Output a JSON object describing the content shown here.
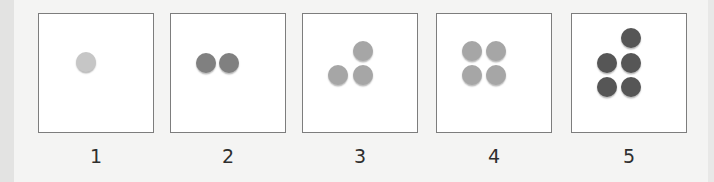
{
  "title": "",
  "colors": {
    "background": "#f4f4f3",
    "panel_border": "#7d7d7d",
    "label_text": "#2e2e2e"
  },
  "panels": [
    {
      "label": "1",
      "dot_count": 1,
      "dot_color": "#c6c6c6",
      "dots": [
        [
          47,
          48
        ]
      ]
    },
    {
      "label": "2",
      "dot_count": 2,
      "dot_color": "#808080",
      "dots": [
        [
          35,
          49
        ],
        [
          58,
          49
        ]
      ]
    },
    {
      "label": "3",
      "dot_count": 3,
      "dot_color": "#a6a6a6",
      "dots": [
        [
          60,
          37
        ],
        [
          35,
          61
        ],
        [
          60,
          61
        ]
      ]
    },
    {
      "label": "4",
      "dot_count": 4,
      "dot_color": "#a6a6a6",
      "dots": [
        [
          35,
          37
        ],
        [
          59,
          37
        ],
        [
          35,
          61
        ],
        [
          59,
          61
        ]
      ]
    },
    {
      "label": "5",
      "dot_count": 5,
      "dot_color": "#565656",
      "dots": [
        [
          59,
          24
        ],
        [
          35,
          49
        ],
        [
          59,
          49
        ],
        [
          35,
          73
        ],
        [
          59,
          73
        ]
      ]
    }
  ]
}
